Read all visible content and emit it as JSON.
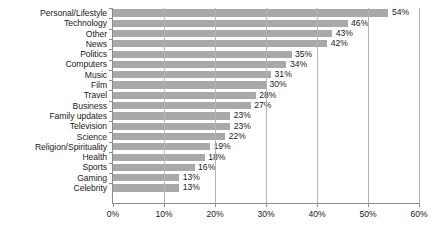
{
  "chart_data": {
    "type": "bar",
    "orientation": "horizontal",
    "title": "",
    "subtitle": "",
    "xlabel": "",
    "ylabel": "",
    "xlim": [
      0,
      60
    ],
    "grid": true,
    "legend": null,
    "value_label_suffix": "%",
    "bar_color": "#a9a9a9",
    "gridline_color": "#b4b4b4",
    "axis_color": "#8c8c8c",
    "text_color": "#1a1a1a",
    "xticks": [
      {
        "value": 0,
        "label": "0%"
      },
      {
        "value": 10,
        "label": "10%"
      },
      {
        "value": 20,
        "label": "20%"
      },
      {
        "value": 30,
        "label": "30%"
      },
      {
        "value": 40,
        "label": "40%"
      },
      {
        "value": 50,
        "label": "50%"
      },
      {
        "value": 60,
        "label": "60%"
      }
    ],
    "categories": [
      "Personal/Lifestyle",
      "Technology",
      "Other",
      "News",
      "Politics",
      "Computers",
      "Music",
      "Film",
      "Travel",
      "Business",
      "Family updates",
      "Television",
      "Science",
      "Religion/Spirituality",
      "Health",
      "Sports",
      "Gaming",
      "Celebrity"
    ],
    "values": [
      54,
      46,
      43,
      42,
      35,
      34,
      31,
      30,
      28,
      27,
      23,
      23,
      22,
      19,
      18,
      16,
      13,
      13
    ],
    "data_labels": [
      "54%",
      "46%",
      "43%",
      "42%",
      "35%",
      "34%",
      "31%",
      "30%",
      "28%",
      "27%",
      "23%",
      "23%",
      "22%",
      "19%",
      "18%",
      "16%",
      "13%",
      "13%"
    ]
  }
}
